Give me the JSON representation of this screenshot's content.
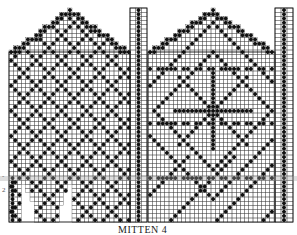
{
  "title": "MITTEN 4",
  "colors": {
    "ink": "#111111",
    "grid": "#444444",
    "paper": "#ffffff",
    "stripe": "#a0a0a0"
  },
  "side_marks": [
    "-",
    "2"
  ],
  "charts": [
    {
      "name": "palm",
      "x0": 9,
      "x1": 130,
      "peak_x": 70,
      "peak_y": 8,
      "shoulder_y": 52,
      "bottom_y": 222,
      "motif": "lattice",
      "strip": {
        "x0": 130,
        "x1": 147,
        "top_y": 8,
        "bottom_y": 222
      },
      "cuff": {
        "x0": 9,
        "x1": 16,
        "top_y": 176
      },
      "thumb": {
        "x0": 22,
        "x1": 72,
        "top_y": 180,
        "bottom_y": 222
      }
    },
    {
      "name": "back",
      "x0": 148,
      "x1": 275,
      "peak_x": 212,
      "peak_y": 8,
      "shoulder_y": 52,
      "bottom_y": 222,
      "motif": "snowflake",
      "strip": {
        "x0": 275,
        "x1": 293,
        "top_y": 8,
        "bottom_y": 222
      }
    }
  ],
  "cell_size": 4.2
}
